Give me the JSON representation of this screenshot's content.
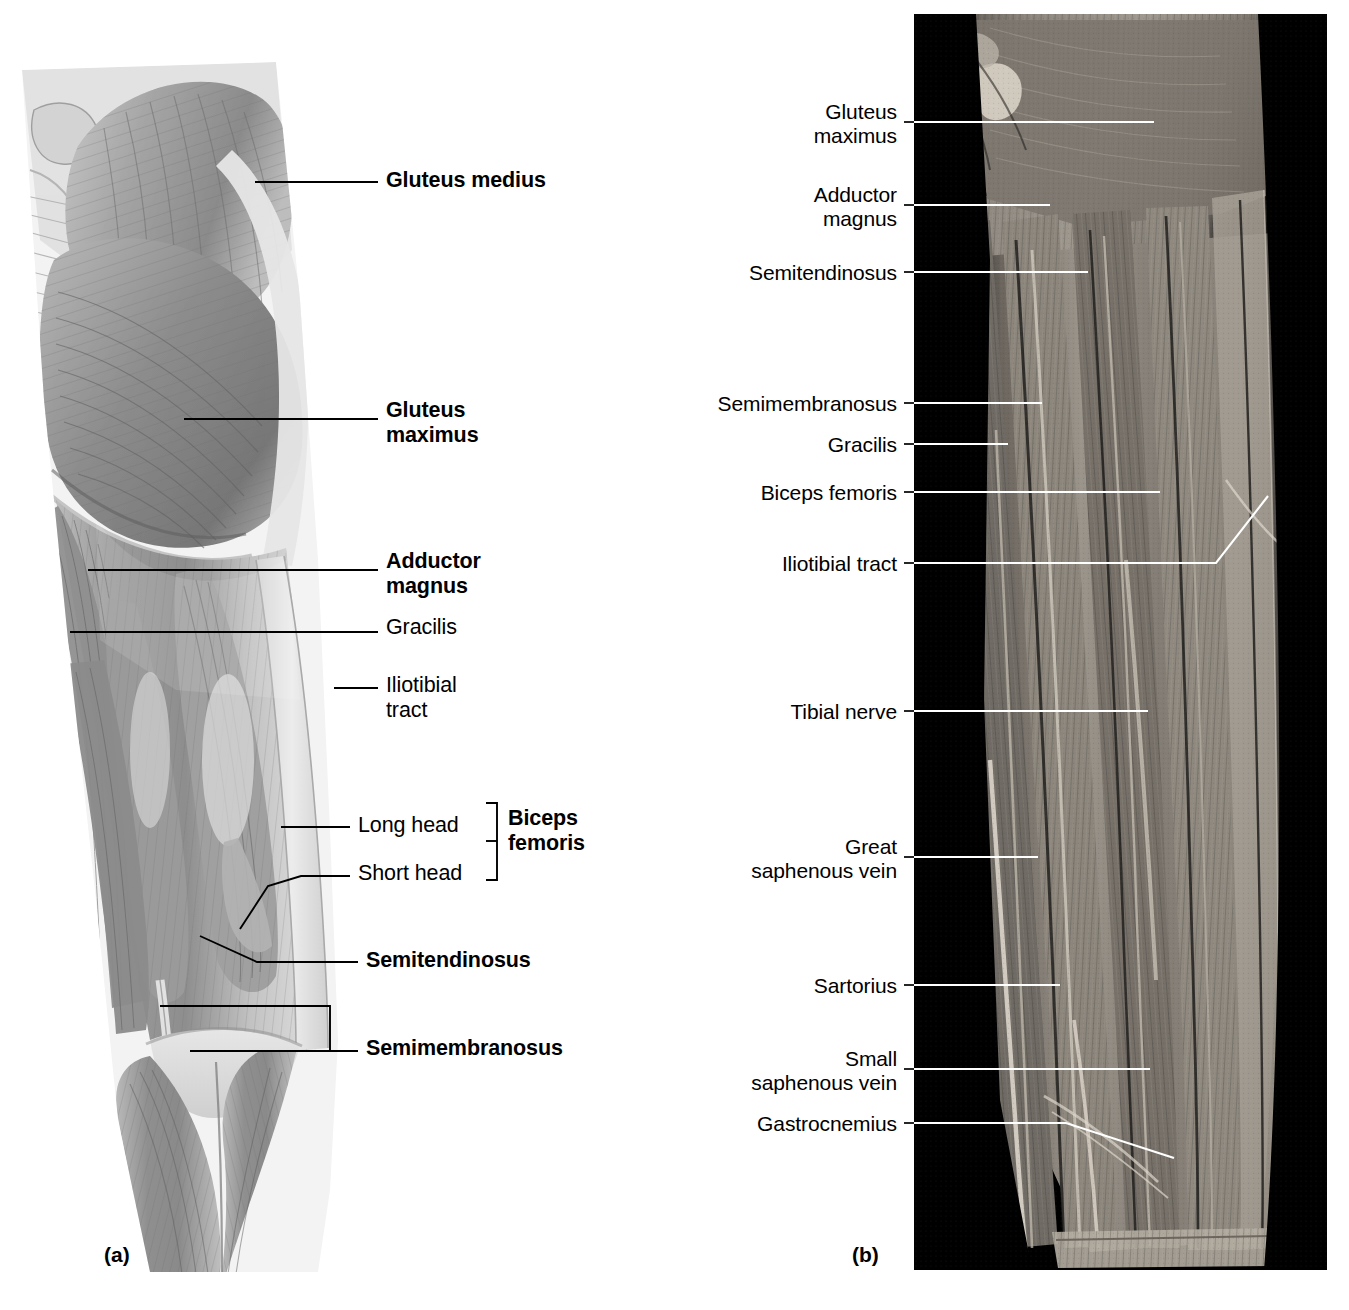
{
  "figure": {
    "top_cut_text": "",
    "panels": [
      {
        "letter": "(a)",
        "kind": "illustration"
      },
      {
        "letter": "(b)",
        "kind": "cadaver-photograph"
      }
    ]
  },
  "panel_a": {
    "letter": "(a)",
    "labels": [
      {
        "id": "gluteus-medius",
        "text": "Gluteus medius",
        "weight": "bold",
        "align": "left",
        "x": 386,
        "y": 168
      },
      {
        "id": "gluteus-maximus",
        "text": "Gluteus\nmaximus",
        "weight": "bold",
        "align": "left",
        "x": 386,
        "y": 398
      },
      {
        "id": "adductor-magnus",
        "text": "Adductor\nmagnus",
        "weight": "bold",
        "align": "left",
        "x": 386,
        "y": 549
      },
      {
        "id": "gracilis",
        "text": "Gracilis",
        "weight": "regular",
        "align": "left",
        "x": 386,
        "y": 615
      },
      {
        "id": "iliotibial-tract",
        "text": "Iliotibial\ntract",
        "weight": "regular",
        "align": "left",
        "x": 386,
        "y": 673
      },
      {
        "id": "long-head",
        "text": "Long head",
        "weight": "regular",
        "align": "left",
        "x": 358,
        "y": 813
      },
      {
        "id": "short-head",
        "text": "Short head",
        "weight": "regular",
        "align": "left",
        "x": 358,
        "y": 861
      },
      {
        "id": "biceps-femoris",
        "text": "Biceps\nfemoris",
        "weight": "bold",
        "align": "left",
        "x": 497,
        "y": 816
      },
      {
        "id": "semitendinosus",
        "text": "Semitendinosus",
        "weight": "bold",
        "align": "left",
        "x": 366,
        "y": 948
      },
      {
        "id": "semimembranosus",
        "text": "Semimembranosus",
        "weight": "bold",
        "align": "left",
        "x": 366,
        "y": 1036
      }
    ]
  },
  "panel_b": {
    "letter": "(b)",
    "labels": [
      {
        "id": "gluteus-maximus",
        "text": "Gluteus\nmaximus",
        "weight": "regular",
        "align": "right",
        "x": 897,
        "y": 110
      },
      {
        "id": "adductor-magnus",
        "text": "Adductor\nmagnus",
        "weight": "regular",
        "align": "right",
        "x": 897,
        "y": 192
      },
      {
        "id": "semitendinosus",
        "text": "Semitendinosus",
        "weight": "regular",
        "align": "right",
        "x": 897,
        "y": 262
      },
      {
        "id": "semimembranosus",
        "text": "Semimembranosus",
        "weight": "regular",
        "align": "right",
        "x": 897,
        "y": 393
      },
      {
        "id": "gracilis",
        "text": "Gracilis",
        "weight": "regular",
        "align": "right",
        "x": 897,
        "y": 434
      },
      {
        "id": "biceps-femoris",
        "text": "Biceps femoris",
        "weight": "regular",
        "align": "right",
        "x": 897,
        "y": 482
      },
      {
        "id": "iliotibial-tract",
        "text": "Iliotibial tract",
        "weight": "regular",
        "align": "right",
        "x": 897,
        "y": 553
      },
      {
        "id": "tibial-nerve",
        "text": "Tibial nerve",
        "weight": "regular",
        "align": "right",
        "x": 897,
        "y": 701
      },
      {
        "id": "great-saphenous-vein",
        "text": "Great\nsaphenous vein",
        "weight": "regular",
        "align": "right",
        "x": 897,
        "y": 835
      },
      {
        "id": "sartorius",
        "text": "Sartorius",
        "weight": "regular",
        "align": "right",
        "x": 897,
        "y": 975
      },
      {
        "id": "small-saphenous-vein",
        "text": "Small\nsaphenous vein",
        "weight": "regular",
        "align": "right",
        "x": 897,
        "y": 1047
      },
      {
        "id": "gastrocnemius",
        "text": "Gastrocnemius",
        "weight": "regular",
        "align": "right",
        "x": 897,
        "y": 1113
      }
    ]
  },
  "colors": {
    "background": "#ffffff",
    "ink": "#000000",
    "leader_in_photo": "#ffffff",
    "photo_matte": "#000000",
    "illustration_mid": "#9a9a9a",
    "illustration_light": "#d8d8d8",
    "illustration_dark": "#6a6a6a"
  }
}
